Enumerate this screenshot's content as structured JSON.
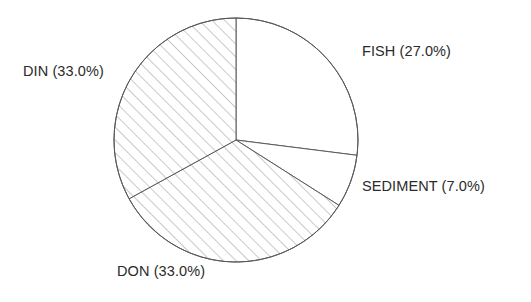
{
  "chart_data": {
    "type": "pie",
    "title": "",
    "subtitle": "",
    "xlabel": "",
    "ylabel": "",
    "legend_position": "none",
    "grid": false,
    "start_angle_deg": 90,
    "direction": "clockwise",
    "categories": [
      "FISH",
      "SEDIMENT",
      "DON",
      "DIN"
    ],
    "values": [
      27.0,
      7.0,
      33.0,
      33.0
    ],
    "value_unit": "%",
    "labels": [
      "FISH (27.0%)",
      "SEDIMENT (7.0%)",
      "DON (33.0%)",
      "DIN (33.0%)"
    ],
    "slices": [
      {
        "name": "FISH",
        "value": 27.0,
        "label": "FISH (27.0%)",
        "fill": "none",
        "hatch": "none",
        "label_position": "right-top"
      },
      {
        "name": "SEDIMENT",
        "value": 7.0,
        "label": "SEDIMENT (7.0%)",
        "fill": "none",
        "hatch": "none",
        "label_position": "right-bottom"
      },
      {
        "name": "DON",
        "value": 33.0,
        "label": "DON (33.0%)",
        "fill": "white",
        "hatch": "diagonal",
        "label_position": "bottom-left"
      },
      {
        "name": "DIN",
        "value": 33.0,
        "label": "DIN (33.0%)",
        "fill": "white",
        "hatch": "diagonal",
        "label_position": "left-top"
      }
    ]
  },
  "chart": {
    "geometry": {
      "center_x": 236,
      "center_y": 140,
      "radius": 122
    },
    "colors": {
      "outline": "#5a5a5a",
      "hatch": "#8a8a8a",
      "text": "#2b2b2b",
      "background": "#ffffff"
    },
    "labels": {
      "fish": "FISH (27.0%)",
      "din": "DIN (33.0%)",
      "sediment": "SEDIMENT (7.0%)",
      "don": "DON (33.0%)"
    }
  }
}
